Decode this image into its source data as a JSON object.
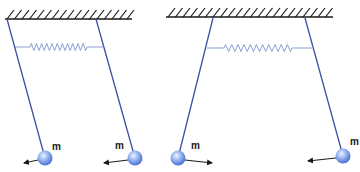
{
  "diagram": {
    "colors": {
      "ceiling": "#1a1a1a",
      "rod": "#3f4fa0",
      "spring": "#8a9fd6",
      "ball_light": "#e8f0ff",
      "ball_mid": "#8fb0ee",
      "ball_dark": "#4d74d8",
      "arrow": "#1a1a1a"
    },
    "systems": [
      {
        "name": "in-phase-left",
        "ceiling": {
          "x1": 5,
          "x2": 132,
          "y": 19
        },
        "spring": {
          "x1": 15,
          "x2": 103,
          "y": 47,
          "coil_start": 30,
          "coil_end": 87
        },
        "pendulums": [
          {
            "pivot": [
              7,
              19
            ],
            "bob": [
              45,
              158
            ],
            "mass_label": "m",
            "label_pos": [
              52,
              150
            ],
            "arrow": {
              "from": [
                38,
                160
              ],
              "to": [
                24,
                163
              ]
            }
          },
          {
            "pivot": [
              96,
              19
            ],
            "bob": [
              135,
              158
            ],
            "mass_label": "m",
            "label_pos": [
              115,
              149
            ],
            "arrow": {
              "from": [
                128,
                160
              ],
              "to": [
                104,
                163
              ]
            }
          }
        ]
      },
      {
        "name": "anti-phase-right",
        "ceiling": {
          "x1": 166,
          "x2": 333,
          "y": 17
        },
        "spring": {
          "x1": 207,
          "x2": 312,
          "y": 48,
          "coil_start": 224,
          "coil_end": 292
        },
        "pendulums": [
          {
            "pivot": [
              213,
              18
            ],
            "bob": [
              178,
              158
            ],
            "mass_label": "m",
            "label_pos": [
              191,
              149
            ],
            "arrow": {
              "from": [
                185,
                160
              ],
              "to": [
                212,
                163
              ]
            }
          },
          {
            "pivot": [
              305,
              18
            ],
            "bob": [
              343,
              156
            ],
            "mass_label": "m",
            "label_pos": [
              350,
              145
            ],
            "arrow": {
              "from": [
                336,
                158
              ],
              "to": [
                308,
                161
              ]
            }
          }
        ]
      }
    ]
  }
}
